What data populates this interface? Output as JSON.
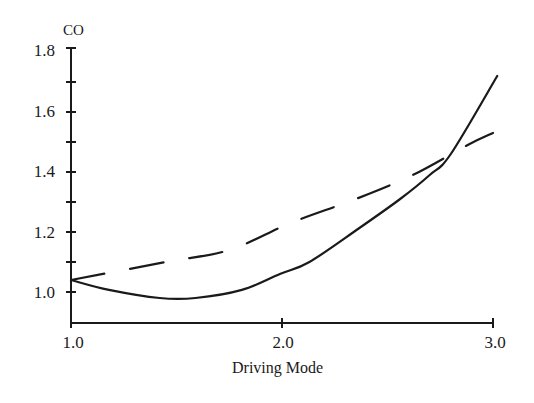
{
  "chart_data": {
    "type": "line",
    "title": "",
    "xlabel": "Driving Mode",
    "ylabel": "CO",
    "xlim": [
      1.0,
      3.0
    ],
    "ylim": [
      0.9,
      1.8
    ],
    "grid": false,
    "legend": null,
    "x_ticks": [
      "1.0",
      "2.0",
      "3.0"
    ],
    "y_ticks": [
      "1.0",
      "1.2",
      "1.4",
      "1.6",
      "1.8"
    ],
    "series": [
      {
        "name": "solid",
        "style": "solid",
        "x": [
          1.0,
          1.18,
          1.42,
          1.59,
          1.81,
          1.99,
          2.13,
          2.36,
          2.56,
          2.7,
          2.8,
          3.02
        ],
        "values": [
          1.04,
          1.007,
          0.98,
          0.98,
          1.007,
          1.06,
          1.1,
          1.21,
          1.31,
          1.39,
          1.46,
          1.72
        ]
      },
      {
        "name": "dashed",
        "style": "dashed",
        "x": [
          1.0,
          1.45,
          1.75,
          2.04,
          2.35,
          2.62,
          2.88,
          3.0
        ],
        "values": [
          1.04,
          1.1,
          1.14,
          1.23,
          1.31,
          1.39,
          1.49,
          1.53
        ]
      }
    ]
  },
  "labels": {
    "ylabel": "CO",
    "xlabel": "Driving Mode",
    "y_1_8": "1.8",
    "y_1_6": "1.6",
    "y_1_4": "1.4",
    "y_1_2": "1.2",
    "y_1_0": "1.0",
    "x_1_0": "1.0",
    "x_2_0": "2.0",
    "x_3_0": "3.0"
  }
}
